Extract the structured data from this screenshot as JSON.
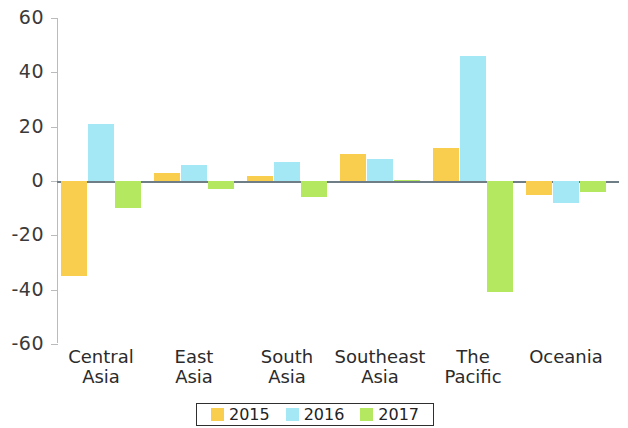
{
  "chart_data": {
    "type": "bar",
    "title": "",
    "subtitle": "",
    "xlabel": "",
    "ylabel": "",
    "categories": [
      "Central Asia",
      "East Asia",
      "South Asia",
      "Southeast Asia",
      "The Pacific",
      "Oceania"
    ],
    "category_lines": [
      [
        "Central",
        "Asia"
      ],
      [
        "East",
        "Asia"
      ],
      [
        "South",
        "Asia"
      ],
      [
        "Southeast",
        "Asia"
      ],
      [
        "The",
        "Pacific"
      ],
      [
        "Oceania",
        ""
      ]
    ],
    "series": [
      {
        "name": "2015",
        "color": "#F9CE4F",
        "values": [
          -35,
          3,
          2,
          10,
          12,
          -5
        ]
      },
      {
        "name": "2016",
        "color": "#A5E8F5",
        "values": [
          21,
          6,
          7,
          8,
          46,
          -8
        ]
      },
      {
        "name": "2017",
        "color": "#B3E860",
        "values": [
          -10,
          -3,
          -6,
          0.5,
          -41,
          -4
        ]
      }
    ],
    "ylim": [
      -60,
      60
    ],
    "yticks": [
      60,
      40,
      20,
      0,
      -20,
      -40,
      -60
    ],
    "ytick_labels": [
      "60",
      "40",
      "20",
      "0",
      "-20",
      "-40",
      "-60"
    ],
    "grid": false,
    "legend_position": "bottom",
    "zero_line": true
  },
  "legend": {
    "items": [
      {
        "label": "2015",
        "color": "#F9CE4F"
      },
      {
        "label": "2016",
        "color": "#A5E8F5"
      },
      {
        "label": "2017",
        "color": "#B3E860"
      }
    ]
  }
}
